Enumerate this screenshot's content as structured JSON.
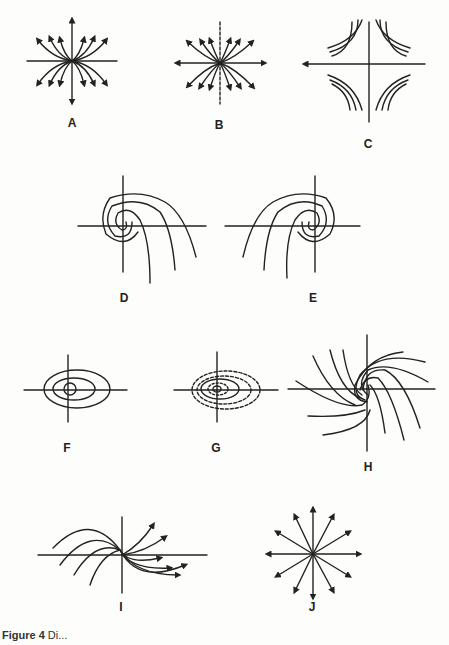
{
  "figure": {
    "panels": [
      {
        "id": "A",
        "label": "A",
        "type": "node (tangent to x-axis)"
      },
      {
        "id": "B",
        "label": "B",
        "type": "node (tangent to y-axis)"
      },
      {
        "id": "C",
        "label": "C",
        "type": "saddle point"
      },
      {
        "id": "D",
        "label": "D",
        "type": "spiral (left)"
      },
      {
        "id": "E",
        "label": "E",
        "type": "spiral (right)"
      },
      {
        "id": "F",
        "label": "F",
        "type": "center (closed orbits)"
      },
      {
        "id": "G",
        "label": "G",
        "type": "center with dashed orbits"
      },
      {
        "id": "H",
        "label": "H",
        "type": "spiral sink"
      },
      {
        "id": "I",
        "label": "I",
        "type": "degenerate node"
      },
      {
        "id": "J",
        "label": "J",
        "type": "star node"
      }
    ],
    "caption": {
      "prefix": "Figure 4",
      "text": " Di..."
    }
  }
}
